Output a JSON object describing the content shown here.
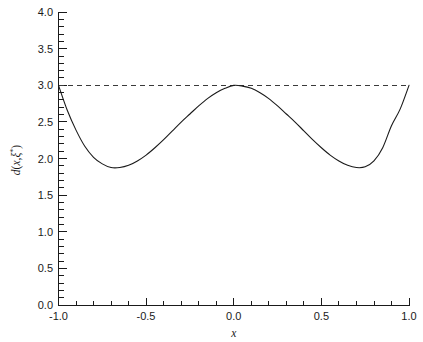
{
  "chart_data": {
    "type": "line",
    "title": "",
    "subtitle": "",
    "xlabel": "x",
    "ylabel": "d(x,ξ*)",
    "ylabel_plain": "d(x, xi*)",
    "xlim": [
      -1.0,
      1.0
    ],
    "ylim": [
      0.0,
      4.0
    ],
    "grid": false,
    "legend": null,
    "x_ticks": [
      -1.0,
      -0.5,
      0.0,
      0.5,
      1.0
    ],
    "x_tick_labels": [
      "-1.0",
      "-0.5",
      "0.0",
      "0.5",
      "1.0"
    ],
    "x_minor_tick_step": 0.1,
    "y_ticks": [
      0.0,
      0.5,
      1.0,
      1.5,
      2.0,
      2.5,
      3.0,
      3.5,
      4.0
    ],
    "y_tick_labels": [
      "0.0",
      "0.5",
      "1.0",
      "1.5",
      "2.0",
      "2.5",
      "3.0",
      "3.5",
      "4.0"
    ],
    "y_minor_tick_step": 0.1,
    "series": [
      {
        "name": "d(x,ξ*)",
        "style": "solid",
        "color": "#1a1a1a",
        "x": [
          -1.0,
          -0.95,
          -0.9,
          -0.85,
          -0.8,
          -0.75,
          -0.7,
          -0.65,
          -0.6,
          -0.55,
          -0.5,
          -0.45,
          -0.4,
          -0.35,
          -0.3,
          -0.25,
          -0.2,
          -0.15,
          -0.1,
          -0.05,
          0.0,
          0.05,
          0.1,
          0.15,
          0.2,
          0.25,
          0.3,
          0.35,
          0.4,
          0.45,
          0.5,
          0.55,
          0.6,
          0.65,
          0.7,
          0.75,
          0.8,
          0.85,
          0.9,
          0.95,
          1.0
        ],
        "y": [
          3.0,
          2.66,
          2.39,
          2.17,
          2.02,
          1.93,
          1.88,
          1.88,
          1.91,
          1.97,
          2.05,
          2.15,
          2.26,
          2.38,
          2.5,
          2.61,
          2.72,
          2.82,
          2.9,
          2.96,
          3.0,
          2.99,
          2.96,
          2.9,
          2.82,
          2.72,
          2.61,
          2.5,
          2.38,
          2.26,
          2.15,
          2.05,
          1.97,
          1.91,
          1.88,
          1.89,
          1.97,
          2.15,
          2.45,
          2.68,
          3.0
        ]
      }
    ],
    "reference_lines": [
      {
        "name": "upper-bound",
        "orientation": "horizontal",
        "value": 3.0,
        "style": "dashed",
        "color": "#3a3a3a"
      }
    ],
    "annotations": {
      "maxima_value": 3.0,
      "minima_value": 1.88,
      "minima_x": [
        -0.7,
        0.72
      ]
    }
  }
}
